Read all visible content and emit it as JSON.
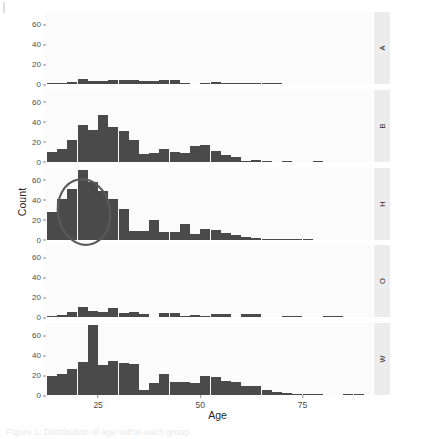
{
  "figure": {
    "title": "",
    "caption": "Figure 1: Distribution of age within each group"
  },
  "axes": {
    "x_label": "Age",
    "y_label": "Count",
    "x_ticks": [
      {
        "label": "25",
        "value": 25
      },
      {
        "label": "50",
        "value": 50
      },
      {
        "label": "75",
        "value": 75
      }
    ],
    "y_ticks": [
      {
        "label": "0",
        "value": 0
      },
      {
        "label": "20",
        "value": 20
      },
      {
        "label": "40",
        "value": 40
      },
      {
        "label": "60",
        "value": 60
      }
    ]
  },
  "annotation": {
    "shape": "ellipse",
    "color": "#5a5a5a",
    "panel": "H",
    "note": "hand-drawn ellipse over the lowest age bins of panel H"
  },
  "colors": {
    "bar_fill": "#4a4a4a",
    "panel_background": "#fbfbfb",
    "strip_background": "#ececec",
    "axis_text": "#4d4d4d"
  },
  "chart_data": {
    "type": "bar",
    "subtype": "faceted-histogram",
    "title": "",
    "xlabel": "Age",
    "ylabel": "Count",
    "xlim": [
      12,
      92
    ],
    "ylim": [
      0,
      72
    ],
    "grid": false,
    "legend": "none",
    "facet_labels": [
      "A",
      "B",
      "H",
      "O",
      "W"
    ],
    "facet_strip_position": "right",
    "bin_width": 2.5,
    "bin_centers": [
      13.75,
      16.25,
      18.75,
      21.25,
      23.75,
      26.25,
      28.75,
      31.25,
      33.75,
      36.25,
      38.75,
      41.25,
      43.75,
      46.25,
      48.75,
      51.25,
      53.75,
      56.25,
      58.75,
      61.25,
      63.75,
      66.25,
      68.75,
      71.25,
      73.75,
      76.25,
      78.75,
      81.25,
      83.75,
      86.25,
      88.75,
      91.25
    ],
    "series": [
      {
        "name": "A",
        "values": [
          1,
          1,
          2,
          5,
          3,
          3,
          4,
          4,
          4,
          3,
          3,
          4,
          4,
          1,
          0,
          1,
          2,
          1,
          1,
          1,
          1,
          1,
          1,
          0,
          0,
          0,
          0,
          0,
          0,
          0,
          0,
          0
        ]
      },
      {
        "name": "B",
        "values": [
          10,
          13,
          22,
          37,
          32,
          47,
          35,
          31,
          22,
          8,
          9,
          13,
          10,
          9,
          16,
          17,
          11,
          7,
          5,
          1,
          2,
          1,
          0,
          1,
          0,
          0,
          1,
          0,
          0,
          0,
          0,
          0
        ]
      },
      {
        "name": "H",
        "values": [
          28,
          41,
          51,
          70,
          58,
          49,
          41,
          31,
          9,
          9,
          20,
          8,
          8,
          16,
          6,
          11,
          10,
          7,
          5,
          3,
          2,
          1,
          1,
          1,
          1,
          1,
          0,
          0,
          0,
          0,
          0,
          0
        ]
      },
      {
        "name": "O",
        "values": [
          1,
          2,
          5,
          10,
          6,
          5,
          9,
          4,
          5,
          3,
          0,
          4,
          4,
          1,
          2,
          1,
          3,
          3,
          0,
          3,
          3,
          0,
          0,
          1,
          1,
          0,
          0,
          1,
          1,
          0,
          0,
          0
        ]
      },
      {
        "name": "W",
        "values": [
          19,
          21,
          26,
          33,
          70,
          30,
          34,
          32,
          31,
          5,
          12,
          21,
          13,
          13,
          12,
          19,
          18,
          14,
          13,
          9,
          9,
          5,
          3,
          2,
          1,
          1,
          1,
          0,
          0,
          1,
          1,
          0
        ]
      }
    ]
  }
}
